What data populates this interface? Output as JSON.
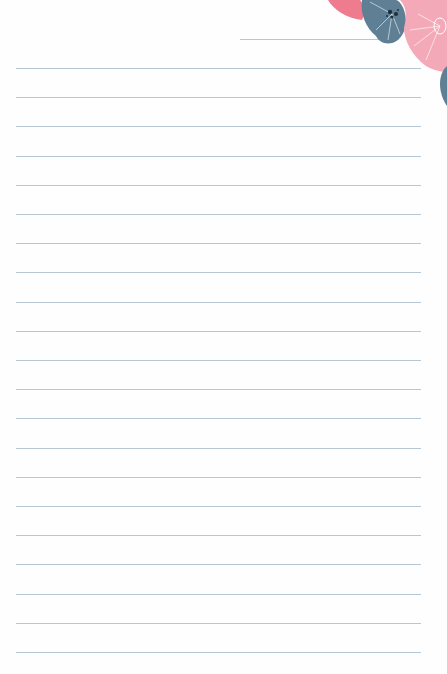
{
  "paper": {
    "background": "#fefefe",
    "line_color": "#b9c7d3",
    "header_line": {
      "x1": 240,
      "x2": 380,
      "y": 39
    },
    "lines": {
      "count": 21,
      "x1": 16,
      "x2": 421,
      "first_y": 68,
      "spacing": 29.2
    }
  },
  "decoration": {
    "name": "floral-corner",
    "colors": {
      "coral": "#ef7b8e",
      "slate": "#5f7f95",
      "pink": "#f4a9b8",
      "dark": "#2a3f52"
    }
  }
}
